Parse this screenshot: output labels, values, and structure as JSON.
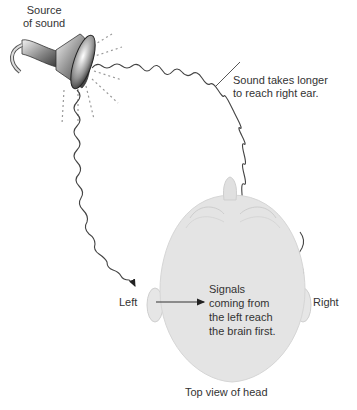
{
  "diagram": {
    "source_label_line1": "Source",
    "source_label_line2": "of sound",
    "longer_label_line1": "Sound takes longer",
    "longer_label_line2": "to reach right ear.",
    "left_label": "Left",
    "right_label": "Right",
    "signals_line1": "Signals",
    "signals_line2": "coming from",
    "signals_line3": "the left reach",
    "signals_line4": "the brain first.",
    "caption": "Top view of head"
  },
  "colors": {
    "head_fill": "#e4e4e4",
    "head_outline": "#cfcfcf",
    "wave": "#444444",
    "dash": "#9a9a9a",
    "text": "#333333"
  }
}
